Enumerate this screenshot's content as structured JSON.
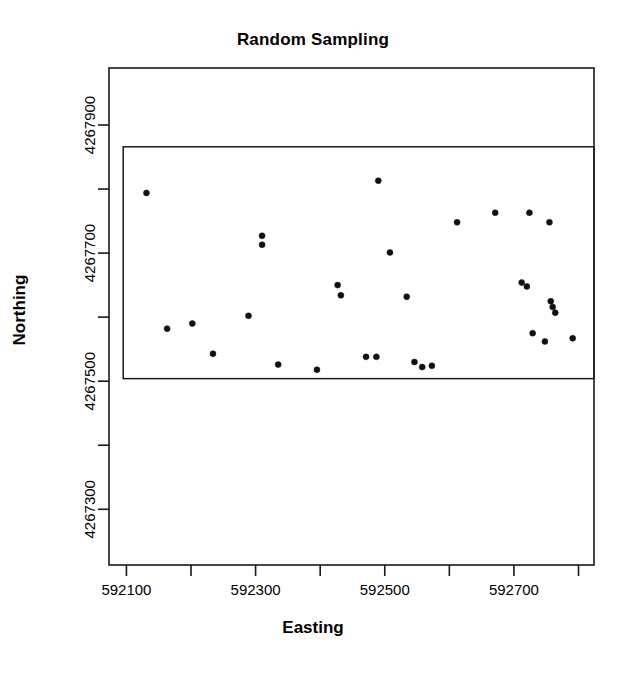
{
  "chart_data": {
    "type": "scatter",
    "title": "Random Sampling",
    "xlabel": "Easting",
    "ylabel": "Northing",
    "xlim": [
      592073,
      592824
    ],
    "ylim": [
      4267213,
      4267989
    ],
    "grid": false,
    "legend": null,
    "x_ticks_labeled": [
      592100,
      592300,
      592500,
      592700
    ],
    "x_tick_labels": [
      "592100",
      "592300",
      "592500",
      "592700"
    ],
    "x_ticks_minor": [
      592200,
      592400,
      592600,
      592800
    ],
    "y_ticks_labeled": [
      4267300,
      4267500,
      4267700,
      4267900
    ],
    "y_tick_labels": [
      "4267300",
      "4267500",
      "4267700",
      "4267900"
    ],
    "y_ticks_minor": [
      4267400,
      4267600,
      4267800
    ],
    "boundary_box": {
      "label": "sampling-region",
      "xmin": 592095,
      "xmax": 592824,
      "ymin": 4267504,
      "ymax": 4267866
    },
    "marker": {
      "shape": "circle",
      "filled": true,
      "color": "#111111",
      "size_px": 6
    },
    "points": [
      {
        "x": 592131,
        "y": 4267794
      },
      {
        "x": 592163,
        "y": 4267582
      },
      {
        "x": 592202,
        "y": 4267590
      },
      {
        "x": 592234,
        "y": 4267543
      },
      {
        "x": 592289,
        "y": 4267602
      },
      {
        "x": 592310,
        "y": 4267727
      },
      {
        "x": 592310,
        "y": 4267713
      },
      {
        "x": 592335,
        "y": 4267526
      },
      {
        "x": 592395,
        "y": 4267518
      },
      {
        "x": 592427,
        "y": 4267650
      },
      {
        "x": 592432,
        "y": 4267634
      },
      {
        "x": 592471,
        "y": 4267538
      },
      {
        "x": 592487,
        "y": 4267538
      },
      {
        "x": 592490,
        "y": 4267813
      },
      {
        "x": 592508,
        "y": 4267701
      },
      {
        "x": 592534,
        "y": 4267632
      },
      {
        "x": 592546,
        "y": 4267530
      },
      {
        "x": 592558,
        "y": 4267522
      },
      {
        "x": 592573,
        "y": 4267524
      },
      {
        "x": 592612,
        "y": 4267748
      },
      {
        "x": 592671,
        "y": 4267763
      },
      {
        "x": 592712,
        "y": 4267654
      },
      {
        "x": 592720,
        "y": 4267648
      },
      {
        "x": 592724,
        "y": 4267763
      },
      {
        "x": 592729,
        "y": 4267575
      },
      {
        "x": 592748,
        "y": 4267562
      },
      {
        "x": 592755,
        "y": 4267748
      },
      {
        "x": 592757,
        "y": 4267625
      },
      {
        "x": 592760,
        "y": 4267616
      },
      {
        "x": 592764,
        "y": 4267607
      },
      {
        "x": 592791,
        "y": 4267567
      }
    ]
  }
}
